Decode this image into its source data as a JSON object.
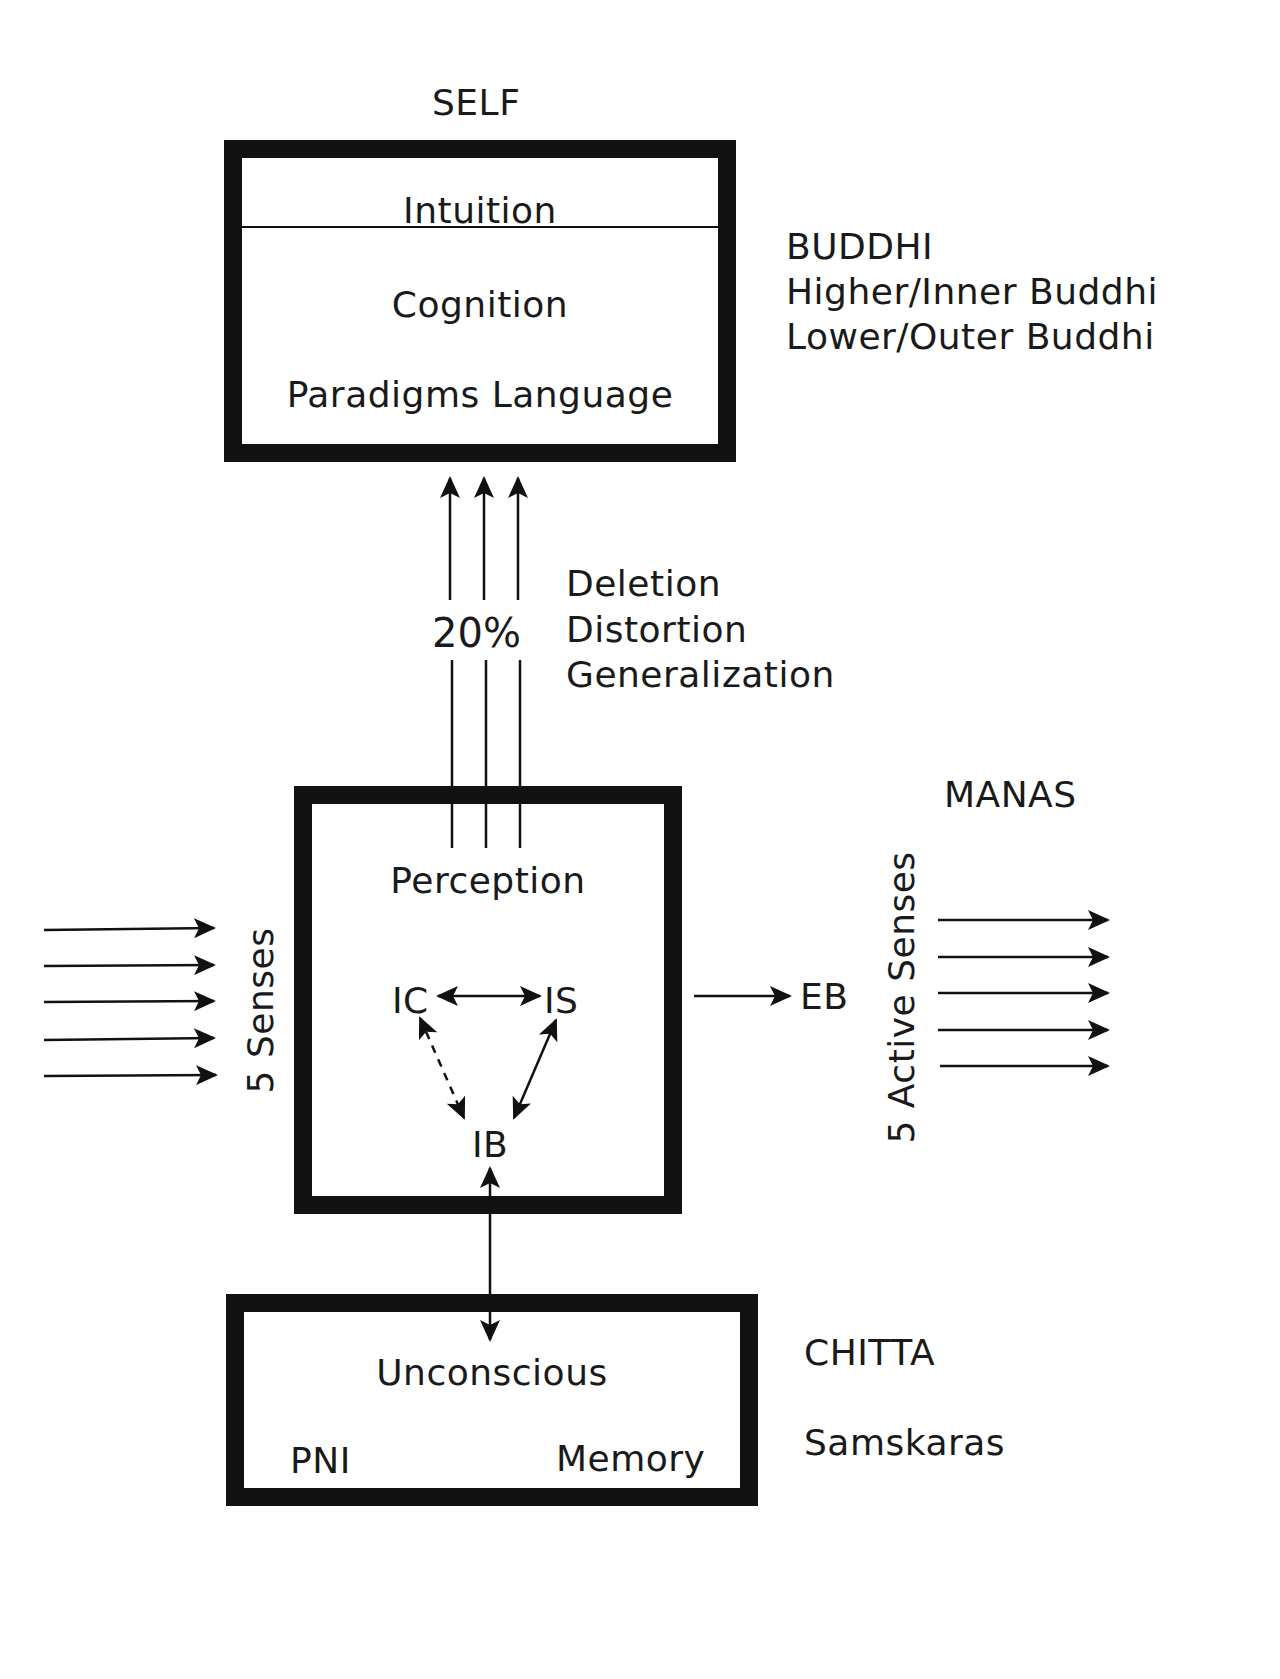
{
  "self": {
    "title": "SELF",
    "intuition": "Intuition",
    "cognition": "Cognition",
    "paradigms": "Paradigms Language"
  },
  "buddhi": {
    "title": "BUDDHI",
    "higher": "Higher/Inner Buddhi",
    "lower": "Lower/Outer Buddhi"
  },
  "filter": {
    "percent": "20%",
    "items": [
      "Deletion",
      "Distortion",
      "Generalization"
    ]
  },
  "manas": {
    "title": "MANAS",
    "perception": "Perception",
    "ic": "IC",
    "is": "IS",
    "ib": "IB",
    "eb": "EB",
    "input_label": "5 Senses",
    "output_label": "5 Active Senses"
  },
  "chitta": {
    "title": "CHITTA",
    "subtitle": "Samskaras",
    "unconscious": "Unconscious",
    "pni": "PNI",
    "memory": "Memory"
  },
  "colors": {
    "stroke": "#111111",
    "background": "#ffffff"
  }
}
